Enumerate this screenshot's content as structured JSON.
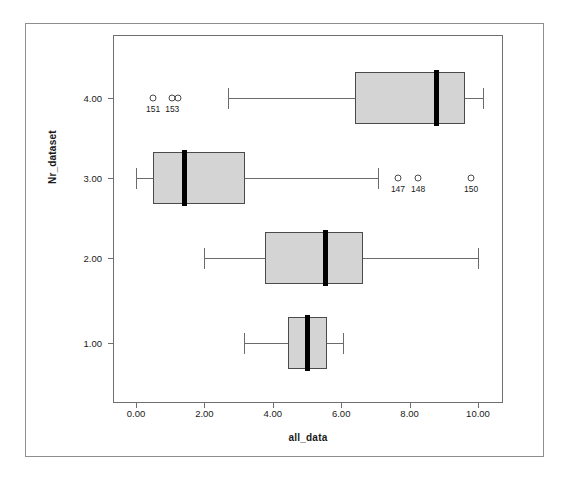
{
  "scan": {
    "top_fragment": ""
  },
  "chart_data": {
    "type": "box",
    "title": "",
    "xlabel": "all_data",
    "ylabel": "Nr_dataset",
    "orientation": "horizontal",
    "xlim": [
      -0.5,
      10.8
    ],
    "xticks": [
      0,
      2,
      4,
      6,
      8,
      10
    ],
    "xticklabels": [
      "0.00",
      "2.00",
      "4.00",
      "6.00",
      "8.00",
      "10.00"
    ],
    "yticks": [
      1,
      2,
      3,
      4
    ],
    "yticklabels": [
      "1.00",
      "2.00",
      "3.00",
      "4.00"
    ],
    "grid": false,
    "legend": false,
    "boxes": [
      {
        "category": "4.00",
        "y": 4,
        "whisker_low": 2.7,
        "q1": 6.4,
        "median": 8.8,
        "q3": 9.62,
        "whisker_high": 10.15,
        "outliers": [
          {
            "value": 0.5,
            "label": "151"
          },
          {
            "value": 1.06,
            "label": "153"
          },
          {
            "value": 1.23,
            "label": ""
          }
        ]
      },
      {
        "category": "3.00",
        "y": 3,
        "whisker_low": 0.0,
        "q1": 0.5,
        "median": 1.43,
        "q3": 3.19,
        "whisker_high": 7.08,
        "outliers": [
          {
            "value": 7.66,
            "label": "147"
          },
          {
            "value": 8.25,
            "label": "148"
          },
          {
            "value": 9.8,
            "label": "150"
          }
        ]
      },
      {
        "category": "2.00",
        "y": 2,
        "whisker_low": 1.99,
        "q1": 3.77,
        "median": 5.53,
        "q3": 6.64,
        "whisker_high": 10.0,
        "outliers": []
      },
      {
        "category": "1.00",
        "y": 1,
        "whisker_low": 3.16,
        "q1": 4.45,
        "median": 5.0,
        "q3": 5.59,
        "whisker_high": 6.05,
        "outliers": []
      }
    ],
    "colors": {
      "box_fill": "#d4d4d4",
      "box_edge": "#4a4a4a",
      "median": "#000000",
      "whisker": "#6b6b6b",
      "frame": "#6f6f6f",
      "outer_frame": "#8e8e8e",
      "text": "#1a1a1a"
    }
  }
}
